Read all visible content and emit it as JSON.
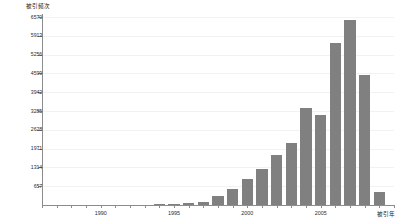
{
  "chart_data": {
    "type": "bar",
    "title": "",
    "xlabel": "被引年",
    "ylabel": "被引频次",
    "categories": [
      1994,
      1995,
      1996,
      1997,
      1998,
      1999,
      2000,
      2001,
      2002,
      2003,
      2004,
      2005,
      2006,
      2007,
      2008,
      2009
    ],
    "values": [
      30,
      45,
      60,
      110,
      330,
      560,
      900,
      1250,
      1750,
      2180,
      3380,
      3150,
      5650,
      6480,
      4560,
      450
    ],
    "ylim": [
      0,
      6570
    ],
    "xlim": [
      1986,
      2010
    ],
    "ytick_labels": [
      "657",
      "1314",
      "1971",
      "2628",
      "3285",
      "3942",
      "4599",
      "5256",
      "5913",
      "6570"
    ],
    "ytick_values": [
      657,
      1314,
      1971,
      2628,
      3285,
      3942,
      4599,
      5256,
      5913,
      6570
    ],
    "xtick_labels": [
      "1990",
      "1995",
      "2000",
      "2005"
    ],
    "xtick_values": [
      1990,
      1995,
      2000,
      2005
    ],
    "grid": true,
    "legend": null,
    "bar_color": "#808080",
    "axis_color": "#8c8c8c",
    "grid_color": "#f2f2f2",
    "background_color": "#ffffff"
  }
}
